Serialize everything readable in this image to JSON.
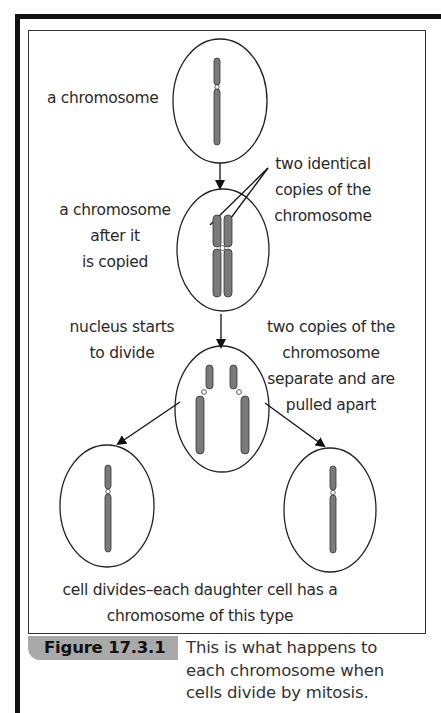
{
  "figure": {
    "number": "Figure 17.3.1",
    "caption_lines": [
      "This is what happens to",
      "each chromosome when",
      "cells divide by mitosis."
    ],
    "caption_tab_color": "#a9a9a9",
    "chromosome_color": "#7a7a7a"
  },
  "labels": {
    "a_chromosome": "a chromosome",
    "after_copied": [
      "a chromosome",
      "after it",
      "is copied"
    ],
    "identical_copies": [
      "two identical",
      "copies of the",
      "chromosome"
    ],
    "nucleus_divide": [
      "nucleus starts",
      "to divide"
    ],
    "copies_separate": [
      "two copies of the",
      "chromosome",
      "separate and are",
      "pulled apart"
    ],
    "cell_divides": [
      "cell divides–each daughter cell has a",
      "chromosome of this type"
    ]
  }
}
